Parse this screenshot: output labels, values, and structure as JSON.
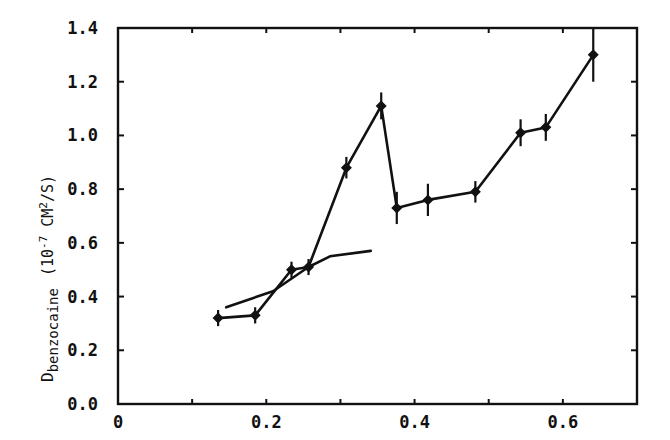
{
  "chart_data": {
    "type": "line",
    "title": "",
    "xlabel": "",
    "ylabel": "D_benzocaine (10^-7 CM^2/S)",
    "ylabel_parts": {
      "main": "D",
      "subscript": "benzocaine",
      "units_prefix": "(10",
      "units_exp": "-7",
      "units_mid": " CM",
      "units_exp2": "2",
      "units_suffix": "/S)"
    },
    "xlim": [
      0,
      0.7
    ],
    "ylim": [
      0.0,
      1.4
    ],
    "x_ticks": [
      0,
      0.1,
      0.2,
      0.3,
      0.4,
      0.5,
      0.6
    ],
    "x_tick_labels": [
      "0",
      "",
      "0.2",
      "",
      "0.4",
      "",
      "0.6"
    ],
    "y_ticks": [
      0.0,
      0.2,
      0.4,
      0.6,
      0.8,
      1.0,
      1.2,
      1.4
    ],
    "y_tick_labels": [
      "0.0",
      "0.2",
      "0.4",
      "0.6",
      "0.8",
      "1.0",
      "1.2",
      "1.4"
    ],
    "grid": false,
    "legend": null,
    "series": [
      {
        "name": "measured",
        "marker": "diamond",
        "error_bars": true,
        "x": [
          0.135,
          0.185,
          0.234,
          0.257,
          0.308,
          0.355,
          0.376,
          0.418,
          0.482,
          0.543,
          0.577,
          0.641
        ],
        "y": [
          0.32,
          0.33,
          0.5,
          0.51,
          0.88,
          1.11,
          0.73,
          0.76,
          0.79,
          1.01,
          1.03,
          1.3
        ],
        "yerr": [
          0.03,
          0.03,
          0.03,
          0.03,
          0.04,
          0.05,
          0.06,
          0.06,
          0.04,
          0.05,
          0.05,
          0.1
        ]
      },
      {
        "name": "model",
        "marker": "none",
        "error_bars": false,
        "x": [
          0.146,
          0.209,
          0.257,
          0.286,
          0.341
        ],
        "y": [
          0.36,
          0.42,
          0.51,
          0.55,
          0.57
        ]
      }
    ]
  },
  "colors": {
    "ink": "#111111",
    "background": "#ffffff"
  }
}
